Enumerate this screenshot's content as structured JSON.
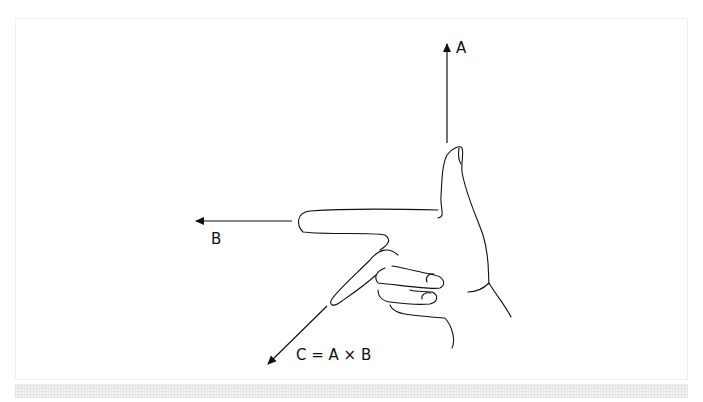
{
  "diagram": {
    "labels": {
      "a": "A",
      "b": "B",
      "c": "C = A × B"
    },
    "vectors": [
      {
        "name": "A",
        "direction": "up"
      },
      {
        "name": "B",
        "direction": "left"
      },
      {
        "name": "C",
        "direction": "down-left",
        "equation": "C = A × B"
      }
    ],
    "colors": {
      "stroke": "#111111",
      "background": "#ffffff",
      "frame": "#f0f0f0"
    }
  }
}
